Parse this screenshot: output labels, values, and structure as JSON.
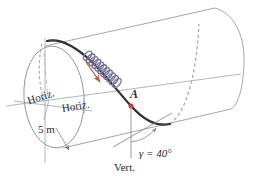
{
  "figure": {
    "background_color": "#ffffff",
    "labels": {
      "horizontal_ref_left": "Horiz.",
      "horizontal_ref_mid": "Horiz.",
      "radius_dimension": "5 m",
      "point_label": "A",
      "angle_label": "γ = 40°",
      "vertical_ref": "Vert."
    },
    "values": {
      "radius_value": 5,
      "radius_unit": "m",
      "angle_symbol": "γ",
      "angle_value": 40,
      "angle_unit": "°"
    },
    "colors": {
      "outline": "#8b8b96",
      "cylinder_edge": "#9a9aa4",
      "path_solid": "#1d1d28",
      "path_dashed": "#9a9aa6",
      "coil": "#8a86a8",
      "coil_dark": "#4b4866",
      "motion_arrow": "#c0573f",
      "point_marker": "#d2342b",
      "construction_line": "#9b9ba6",
      "text": "#2b2b33"
    },
    "elements": {
      "cylinder": "cylinder-body",
      "left_cap": "left-end-ellipse",
      "right_cap": "right-end-ellipse",
      "solid_curve": "helical-path-solid",
      "dashed_curve_left": "helical-path-dashed-hidden-left",
      "dashed_curve_right": "helical-path-dashed-hidden-right",
      "coil": "coil-spring-bead-chain",
      "motion_arrow": "motion-direction-arrow",
      "vertical_axis": "vertical-reference-line",
      "horizontal_axis": "horizontal-reference-line",
      "angle_arc": "angle-arc-gamma",
      "radius_leader": "radius-leader-arrow"
    }
  }
}
